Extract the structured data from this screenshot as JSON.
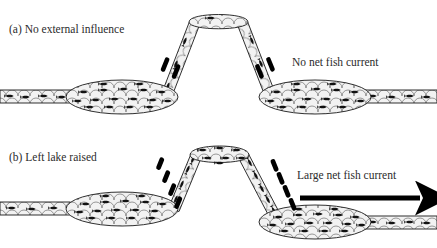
{
  "figure": {
    "background_color": "#ffffff",
    "outline_color": "#1a1a1a",
    "water_fill_color": "#f0f0f0",
    "fish_color": "#111111",
    "arrow_color": "#000000"
  },
  "panels": [
    {
      "id": "a",
      "label": "(a) No external influence",
      "annotation": "No net fish current",
      "left_lake_level": "low",
      "right_lake_level": "low",
      "net_current": "none",
      "flow_arrows": [
        {
          "side": "left-ramp",
          "direction": "up",
          "count": 2
        },
        {
          "side": "right-ramp",
          "direction": "up",
          "count": 2
        }
      ],
      "fish_counts": {
        "left_pipe": 4,
        "left_lake": 17,
        "left_ramp": 3,
        "plateau": 1,
        "right_ramp": 2,
        "right_lake": 17,
        "right_pipe": 4
      }
    },
    {
      "id": "b",
      "label": "(b) Left lake raised",
      "annotation": "Large net fish current",
      "left_lake_level": "raised",
      "right_lake_level": "low",
      "net_current": "rightward",
      "flow_arrows": [
        {
          "side": "left-ramp",
          "direction": "up",
          "count": 4
        },
        {
          "side": "right-ramp",
          "direction": "down",
          "count": 4
        }
      ],
      "fish_counts": {
        "left_pipe": 3,
        "left_lake": 16,
        "left_ramp": 4,
        "plateau": 7,
        "right_ramp": 6,
        "right_lake": 17,
        "right_pipe": 4
      },
      "big_arrow": {
        "name": "net-current-arrow",
        "direction": "right",
        "x_start": 300,
        "x_end": 432,
        "y": 198
      }
    }
  ]
}
